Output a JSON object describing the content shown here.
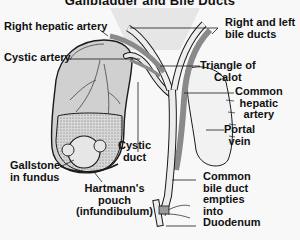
{
  "title": "Gallbladder and Bile Ducts",
  "colors": {
    "background": "#f8f8f8",
    "gallbladder_fill": "#d4d4d4",
    "duct_fill": "#e8e8e8",
    "artery_fill": "#8c8c8c",
    "stone_fill": "#e4e4e4",
    "sludge_fill": "#cfcfcf",
    "outline": "#1a1a1a"
  },
  "labels": {
    "right_hepatic_artery": {
      "lines": [
        "Right hepatic artery"
      ]
    },
    "right_left_bile_ducts": {
      "lines": [
        "Right and left",
        "bile ducts"
      ]
    },
    "cystic_artery": {
      "lines": [
        "Cystic artery"
      ]
    },
    "triangle_of_calot": {
      "lines": [
        "Triangle of",
        "Calot"
      ]
    },
    "common_hepatic_artery": {
      "lines": [
        "Common",
        "hepatic",
        "artery"
      ]
    },
    "portal_vein": {
      "lines": [
        "Portal",
        "vein"
      ]
    },
    "cystic_duct": {
      "lines": [
        "Cystic",
        "duct"
      ]
    },
    "gallstone_in_fundus": {
      "lines": [
        "Gallstone",
        "in fundus"
      ]
    },
    "hartmanns_pouch": {
      "lines": [
        "Hartmann's",
        "pouch",
        "(infundibulum)"
      ]
    },
    "common_bile_duct": {
      "lines": [
        "Common",
        "bile duct",
        "empties",
        "into",
        "Duodenum"
      ]
    }
  }
}
